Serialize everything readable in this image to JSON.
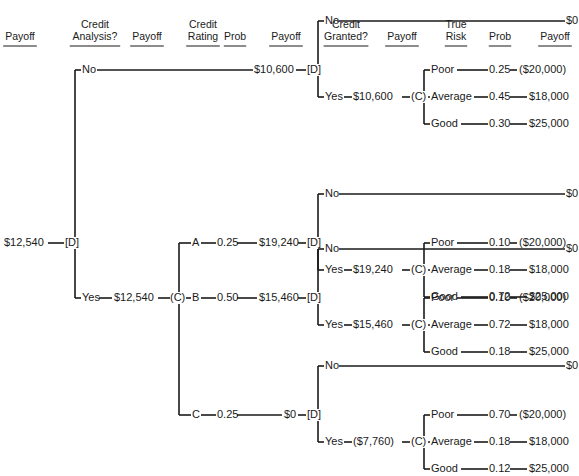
{
  "headers": [
    {
      "lines": [
        "Payoff"
      ],
      "x": 20
    },
    {
      "lines": [
        "Credit",
        "Analysis?"
      ],
      "x": 95
    },
    {
      "lines": [
        "Payoff"
      ],
      "x": 147
    },
    {
      "lines": [
        "Credit",
        "Rating"
      ],
      "x": 203
    },
    {
      "lines": [
        "Prob"
      ],
      "x": 235
    },
    {
      "lines": [
        "Payoff"
      ],
      "x": 286
    },
    {
      "lines": [
        "Credit",
        "Granted?"
      ],
      "x": 346
    },
    {
      "lines": [
        "Payoff"
      ],
      "x": 402
    },
    {
      "lines": [
        "True",
        "Risk"
      ],
      "x": 456
    },
    {
      "lines": [
        "Prob"
      ],
      "x": 500
    },
    {
      "lines": [
        "Payoff"
      ],
      "x": 555
    }
  ],
  "root": {
    "value": "$12,540",
    "node": "[D]"
  },
  "branches": {
    "no": {
      "label": "No",
      "value": "$10,600",
      "node": "[D]"
    },
    "yes": {
      "label": "Yes",
      "value": "$12,540",
      "node": "(C)"
    }
  },
  "ratings": [
    {
      "label": "A",
      "prob": "0.25",
      "value": "$19,240"
    },
    {
      "label": "B",
      "prob": "0.50",
      "value": "$15,460"
    },
    {
      "label": "C",
      "prob": "0.25",
      "value": "$0"
    }
  ],
  "grant_subtrees": [
    {
      "no_label": "No",
      "no_payoff": "$0",
      "yes_label": "Yes",
      "yes_value": "$10,600",
      "chance": "(C)",
      "outcomes": [
        {
          "risk": "Poor",
          "prob": "0.25",
          "payoff": "($20,000)"
        },
        {
          "risk": "Average",
          "prob": "0.45",
          "payoff": "$18,000"
        },
        {
          "risk": "Good",
          "prob": "0.30",
          "payoff": "$25,000"
        }
      ]
    },
    {
      "no_label": "No",
      "no_payoff": "$0",
      "yes_label": "Yes",
      "yes_value": "$19,240",
      "chance": "(C)",
      "outcomes": [
        {
          "risk": "Poor",
          "prob": "0.10",
          "payoff": "($20,000)"
        },
        {
          "risk": "Average",
          "prob": "0.18",
          "payoff": "$18,000"
        },
        {
          "risk": "Good",
          "prob": "0.72",
          "payoff": "$25,000"
        }
      ]
    },
    {
      "no_label": "No",
      "no_payoff": "$0",
      "yes_label": "Yes",
      "yes_value": "$15,460",
      "chance": "(C)",
      "outcomes": [
        {
          "risk": "Poor",
          "prob": "0.10",
          "payoff": "($20,000)"
        },
        {
          "risk": "Average",
          "prob": "0.72",
          "payoff": "$18,000"
        },
        {
          "risk": "Good",
          "prob": "0.18",
          "payoff": "$25,000"
        }
      ]
    },
    {
      "no_label": "No",
      "no_payoff": "$0",
      "yes_label": "Yes",
      "yes_value": "($7,760)",
      "chance": "(C)",
      "outcomes": [
        {
          "risk": "Poor",
          "prob": "0.70",
          "payoff": "($20,000)"
        },
        {
          "risk": "Average",
          "prob": "0.18",
          "payoff": "$18,000"
        },
        {
          "risk": "Good",
          "prob": "0.12",
          "payoff": "$25,000"
        }
      ]
    }
  ]
}
